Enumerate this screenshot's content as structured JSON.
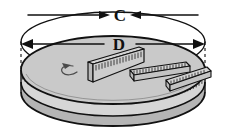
{
  "figure": {
    "alt": "A shaded cylindrical disc drawn in perspective. A measuring tape is wrapped around its side showing the circumference C. A ruler lies across the top surface showing the diameter D. Two more rulers rest on and beside the disc.",
    "labels": {
      "circumference": "C",
      "diameter": "D"
    },
    "colors": {
      "top_face": "#c9c9c9",
      "side_wall": "#b5b5b5",
      "tape_band": "#d6d6d6",
      "ruler_face": "#d3d3d3",
      "ruler_edge": "#9a9a9a",
      "ink": "#111111",
      "paper": "#ffffff"
    },
    "annotations": {
      "circumference_arrows": "both-ends-inward",
      "diameter_arrows": "both-ends-outward",
      "spin_arrow": "counterclockwise-curl"
    },
    "tick_counts": {
      "tape_band": 64,
      "upright_ruler": 16,
      "flat_ruler": 18,
      "edge_ruler": 12
    }
  }
}
